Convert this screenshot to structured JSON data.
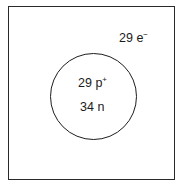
{
  "diagram": {
    "type": "atom-model",
    "electrons": {
      "count": "29",
      "symbol": "e",
      "charge": "−"
    },
    "nucleus": {
      "protons": {
        "count": "29",
        "symbol": "p",
        "charge": "+"
      },
      "neutrons": {
        "count": "34",
        "symbol": "n"
      }
    },
    "colors": {
      "line": "#1e1e1e",
      "text": "#1a1a1a",
      "background": "#ffffff"
    }
  }
}
